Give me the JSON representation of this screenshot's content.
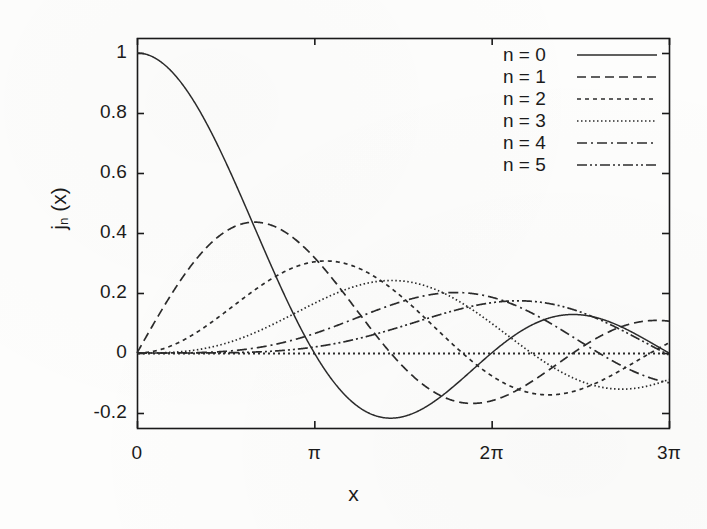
{
  "chart_data": {
    "type": "line",
    "title": "",
    "xlabel": "x",
    "ylabel": "j_n (x)",
    "ylabel_base": "j",
    "ylabel_sub": "n",
    "ylabel_arg": "(x)",
    "xlim": [
      0,
      9.42477796
    ],
    "ylim": [
      -0.25,
      1.05
    ],
    "grid": false,
    "legend_position": "top-right",
    "x_tick_values": [
      0,
      3.14159265,
      6.28318531,
      9.42477796
    ],
    "x_tick_labels": [
      "0",
      "π",
      "2π",
      "3π"
    ],
    "y_tick_values": [
      1,
      0.8,
      0.6,
      0.4,
      0.2,
      0,
      -0.2
    ],
    "y_tick_labels": [
      "1",
      "0.8",
      "0.6",
      "0.4",
      "0.2",
      "0",
      "-0.2"
    ],
    "zero_line": {
      "value": 0,
      "style": "dotted"
    },
    "line_color": "#2b2b2b",
    "frame_color": "#1a1a1a",
    "series": [
      {
        "name": "n = 0",
        "n": 0,
        "style": "solid",
        "dasharray": "",
        "points_x": [
          0.0,
          0.19,
          0.38,
          0.57,
          0.75,
          0.94,
          1.13,
          1.32,
          1.51,
          1.7,
          1.88,
          2.07,
          2.26,
          2.45,
          2.64,
          2.83,
          3.02,
          3.2,
          3.39,
          3.58,
          3.77,
          3.96,
          4.15,
          4.33,
          4.52,
          4.71,
          4.9,
          5.09,
          5.28,
          5.47,
          5.65,
          5.84,
          6.03,
          6.22,
          6.41,
          6.6,
          6.78,
          6.97,
          7.16,
          7.35,
          7.54,
          7.73,
          7.91,
          8.1,
          8.29,
          8.48,
          8.67,
          8.86,
          9.05,
          9.23,
          9.42
        ],
        "points_y": [
          1.0,
          0.994,
          0.976,
          0.947,
          0.908,
          0.859,
          0.802,
          0.738,
          0.668,
          0.595,
          0.519,
          0.442,
          0.365,
          0.29,
          0.218,
          0.15,
          0.087,
          0.03,
          -0.021,
          -0.065,
          -0.102,
          -0.132,
          -0.155,
          -0.171,
          -0.18,
          -0.182,
          -0.179,
          -0.17,
          -0.157,
          -0.14,
          -0.12,
          -0.098,
          -0.075,
          -0.051,
          -0.027,
          -0.004,
          0.018,
          0.038,
          0.056,
          0.072,
          0.085,
          0.095,
          0.102,
          0.106,
          0.107,
          0.105,
          0.1,
          0.093,
          0.083,
          0.072,
          0.059
        ]
      },
      {
        "name": "n = 1",
        "n": 1,
        "style": "dashed",
        "dasharray": "9,5",
        "peak": 0.4345,
        "peak_x": 2.0816
      },
      {
        "name": "n = 2",
        "n": 2,
        "style": "dotted-coarse",
        "dasharray": "4,4",
        "peak": 0.3001,
        "peak_x": 3.3421
      },
      {
        "name": "n = 3",
        "n": 3,
        "style": "dotted-fine",
        "dasharray": "1.5,2.5",
        "peak": 0.2347,
        "peak_x": 4.5141
      },
      {
        "name": "n = 4",
        "n": 4,
        "style": "dash-dot",
        "dasharray": "10,4,2,4",
        "peak": 0.1934,
        "peak_x": 5.6467
      },
      {
        "name": "n = 5",
        "n": 5,
        "style": "dash-dot-dot",
        "dasharray": "10,3,2,3,2,3",
        "peak": 0.1655,
        "peak_x": 6.7565
      }
    ],
    "legend_entries": [
      {
        "label": "n = 0",
        "style": "solid"
      },
      {
        "label": "n = 1",
        "style": "dashed"
      },
      {
        "label": "n = 2",
        "style": "dotted-coarse"
      },
      {
        "label": "n = 3",
        "style": "dotted-fine"
      },
      {
        "label": "n = 4",
        "style": "dash-dot"
      },
      {
        "label": "n = 5",
        "style": "dash-dot-dot"
      }
    ]
  },
  "ticks": {
    "y": [
      {
        "label": "1",
        "value": 1
      },
      {
        "label": "0.8",
        "value": 0.8
      },
      {
        "label": "0.6",
        "value": 0.6
      },
      {
        "label": "0.4",
        "value": 0.4
      },
      {
        "label": "0.2",
        "value": 0.2
      },
      {
        "label": "0",
        "value": 0
      },
      {
        "label": "-0.2",
        "value": -0.2
      }
    ],
    "x": [
      {
        "label": "0",
        "value": 0
      },
      {
        "label": "π",
        "value": 3.14159265
      },
      {
        "label": "2π",
        "value": 6.28318531
      },
      {
        "label": "3π",
        "value": 9.42477796
      }
    ]
  },
  "labels": {
    "x_axis_title": "x",
    "y_axis_base": "j",
    "y_axis_sub": "n",
    "y_axis_arg": " (x)"
  }
}
